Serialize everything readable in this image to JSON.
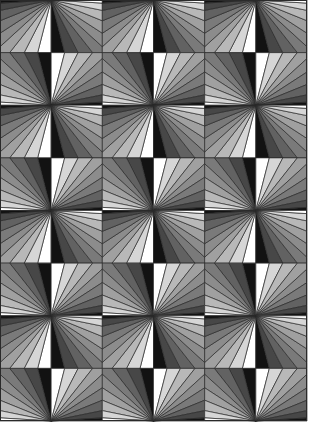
{
  "pattern": {
    "name": "fan-quilt",
    "columns": 6,
    "rows": 8,
    "width": 307,
    "height": 421,
    "background": "#ffffff",
    "line_color": "#2a2a2a",
    "shades_light_to_dark": [
      "#ffffff",
      "#d6d6d6",
      "#b8b8b8",
      "#a0a0a0",
      "#8c8c8c",
      "#7a7a7a",
      "#626262",
      "#474747",
      "#121212"
    ],
    "wedge_fractions": [
      0,
      0.13,
      0.26,
      0.4,
      0.55,
      0.68,
      0.8,
      0.9,
      0.97,
      1.0
    ]
  }
}
